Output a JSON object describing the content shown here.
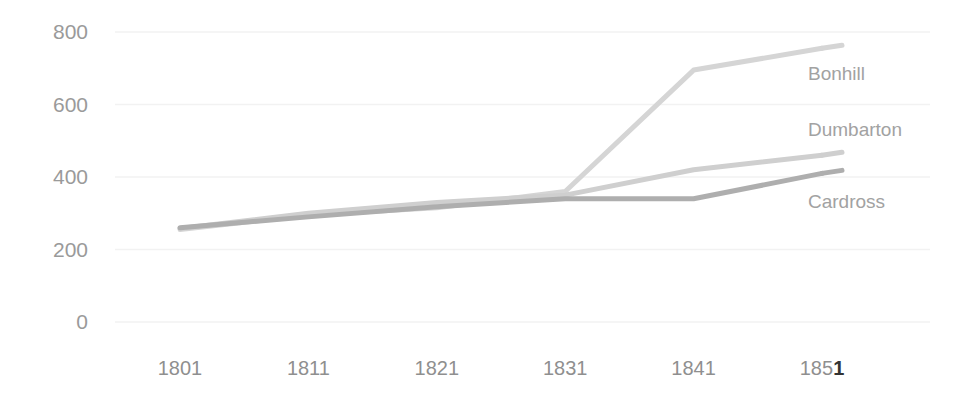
{
  "chart_data": {
    "type": "line",
    "title": "",
    "subtitle": "",
    "xlabel": "",
    "ylabel": "",
    "categories": [
      "1801",
      "1811",
      "1821",
      "1831",
      "1841",
      "1851"
    ],
    "x": [
      1801,
      1811,
      1821,
      1831,
      1841,
      1851
    ],
    "series": [
      {
        "name": "Bonhill",
        "values": [
          255,
          295,
          315,
          360,
          695,
          755
        ],
        "color": "#d5d5d5"
      },
      {
        "name": "Dumbarton",
        "values": [
          258,
          300,
          330,
          350,
          420,
          460
        ],
        "color": "#cfcfcf"
      },
      {
        "name": "Cardross",
        "values": [
          260,
          290,
          318,
          340,
          340,
          410
        ],
        "color": "#aeaeae"
      }
    ],
    "ylim": [
      0,
      800
    ],
    "yticks": [
      0,
      200,
      400,
      600,
      800
    ],
    "ytick_labels": [
      "0",
      "200",
      "400",
      "600",
      "800"
    ],
    "xtick_labels": [
      "1801",
      "1811",
      "1821",
      "1831",
      "1851"
    ],
    "grid": true,
    "grid_color": "#f2f2f2",
    "legend_position": "right-inline",
    "legend_entries": [
      "Bonhill",
      "Dumbarton",
      "Cardross"
    ],
    "annotations": []
  },
  "axis": {
    "y_ticks": [
      {
        "label": "800",
        "value": 800
      },
      {
        "label": "600",
        "value": 600
      },
      {
        "label": "400",
        "value": 400
      },
      {
        "label": "200",
        "value": 200
      },
      {
        "label": "0",
        "value": 0
      }
    ],
    "x_ticks": [
      {
        "label": "1801",
        "head": "1801",
        "tail": ""
      },
      {
        "label": "1811",
        "head": "1811",
        "tail": ""
      },
      {
        "label": "1821",
        "head": "1821",
        "tail": ""
      },
      {
        "label": "1831",
        "head": "1831",
        "tail": ""
      },
      {
        "label": "1841",
        "head": "1841",
        "tail": ""
      },
      {
        "label": "1851",
        "head": "185",
        "tail": "1"
      }
    ]
  },
  "labels": {
    "bonhill": "Bonhill",
    "dumbarton": "Dumbarton",
    "cardross": "Cardross"
  }
}
